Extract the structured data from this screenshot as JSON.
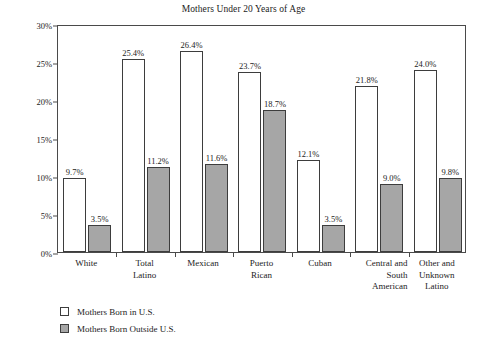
{
  "chart_data": {
    "type": "bar",
    "title": "Mothers Under 20 Years of Age",
    "xlabel": "",
    "ylabel": "",
    "ylim": [
      0,
      30
    ],
    "grid": false,
    "legend_position": "below-left",
    "y_ticks": [
      "0%",
      "5%",
      "10%",
      "15%",
      "20%",
      "25%",
      "30%"
    ],
    "y_tick_values": [
      0,
      5,
      10,
      15,
      20,
      25,
      30
    ],
    "categories": [
      "White",
      "Total\nLatino",
      "Mexican",
      "Puerto\nRican",
      "Cuban",
      "Central and\nSouth\nAmerican",
      "Other and\nUnknown\nLatino"
    ],
    "series": [
      {
        "name": "Mothers Born in U.S.",
        "color": "#ffffff",
        "values": [
          9.7,
          25.4,
          26.4,
          23.7,
          12.1,
          21.8,
          24.0
        ],
        "labels": [
          "9.7%",
          "25.4%",
          "26.4%",
          "23.7%",
          "12.1%",
          "21.8%",
          "24.0%"
        ]
      },
      {
        "name": "Mothers Born Outside U.S.",
        "color": "#a6a6a6",
        "values": [
          3.5,
          11.2,
          11.6,
          18.7,
          3.5,
          9.0,
          9.8
        ],
        "labels": [
          "3.5%",
          "11.2%",
          "11.6%",
          "18.7%",
          "3.5%",
          "9.0%",
          "9.8%"
        ]
      }
    ]
  },
  "legend": {
    "items": [
      {
        "label": "Mothers Born in U.S.",
        "swatch": "white-square-swatch"
      },
      {
        "label": "Mothers Born Outside U.S.",
        "swatch": "gray-square-swatch"
      }
    ]
  }
}
